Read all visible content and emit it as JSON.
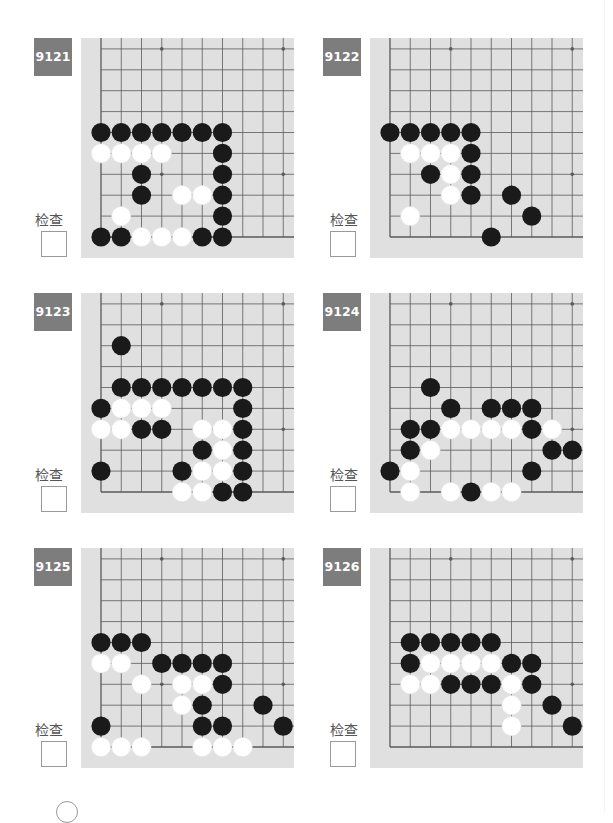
{
  "page": {
    "check_label": "检查",
    "colors": {
      "badge_bg": "#7d7d7d",
      "board_bg": "#e0e0e0",
      "grid_line": "#5a5a5a",
      "black_stone": "#1a1a1a",
      "white_stone": "#ffffff"
    }
  },
  "board_spec": {
    "columns_visible": 10,
    "rows_visible": 10,
    "corner": "bottom-left",
    "star_points": [
      [
        3,
        3
      ],
      [
        9,
        3
      ],
      [
        3,
        9
      ],
      [
        9,
        9
      ]
    ]
  },
  "problems": [
    {
      "number": "9121",
      "check_label": "检查",
      "checked": false,
      "stones": {
        "black": [
          [
            0,
            5
          ],
          [
            1,
            5
          ],
          [
            2,
            5
          ],
          [
            3,
            5
          ],
          [
            4,
            5
          ],
          [
            5,
            5
          ],
          [
            6,
            5
          ],
          [
            6,
            4
          ],
          [
            2,
            3
          ],
          [
            6,
            3
          ],
          [
            2,
            2
          ],
          [
            6,
            2
          ],
          [
            6,
            1
          ],
          [
            0,
            0
          ],
          [
            1,
            0
          ],
          [
            5,
            0
          ],
          [
            6,
            0
          ]
        ],
        "white": [
          [
            0,
            4
          ],
          [
            1,
            4
          ],
          [
            2,
            4
          ],
          [
            3,
            4
          ],
          [
            4,
            2
          ],
          [
            5,
            2
          ],
          [
            1,
            1
          ],
          [
            2,
            0
          ],
          [
            3,
            0
          ],
          [
            4,
            0
          ]
        ]
      }
    },
    {
      "number": "9122",
      "check_label": "检查",
      "checked": false,
      "stones": {
        "black": [
          [
            0,
            5
          ],
          [
            1,
            5
          ],
          [
            2,
            5
          ],
          [
            3,
            5
          ],
          [
            4,
            5
          ],
          [
            4,
            4
          ],
          [
            2,
            3
          ],
          [
            4,
            3
          ],
          [
            4,
            2
          ],
          [
            6,
            2
          ],
          [
            7,
            1
          ],
          [
            5,
            0
          ]
        ],
        "white": [
          [
            1,
            4
          ],
          [
            2,
            4
          ],
          [
            3,
            4
          ],
          [
            3,
            3
          ],
          [
            3,
            2
          ],
          [
            1,
            1
          ]
        ]
      }
    },
    {
      "number": "9123",
      "check_label": "检查",
      "checked": false,
      "stones": {
        "black": [
          [
            1,
            7
          ],
          [
            1,
            5
          ],
          [
            2,
            5
          ],
          [
            3,
            5
          ],
          [
            4,
            5
          ],
          [
            5,
            5
          ],
          [
            6,
            5
          ],
          [
            7,
            5
          ],
          [
            0,
            4
          ],
          [
            7,
            4
          ],
          [
            2,
            3
          ],
          [
            3,
            3
          ],
          [
            7,
            3
          ],
          [
            5,
            2
          ],
          [
            7,
            2
          ],
          [
            0,
            1
          ],
          [
            4,
            1
          ],
          [
            7,
            1
          ],
          [
            6,
            0
          ],
          [
            7,
            0
          ]
        ],
        "white": [
          [
            1,
            4
          ],
          [
            2,
            4
          ],
          [
            3,
            4
          ],
          [
            0,
            3
          ],
          [
            1,
            3
          ],
          [
            5,
            3
          ],
          [
            6,
            3
          ],
          [
            6,
            2
          ],
          [
            5,
            1
          ],
          [
            6,
            1
          ],
          [
            4,
            0
          ],
          [
            5,
            0
          ]
        ]
      }
    },
    {
      "number": "9124",
      "check_label": "检查",
      "checked": false,
      "stones": {
        "black": [
          [
            2,
            5
          ],
          [
            3,
            4
          ],
          [
            5,
            4
          ],
          [
            6,
            4
          ],
          [
            7,
            4
          ],
          [
            1,
            3
          ],
          [
            2,
            3
          ],
          [
            7,
            3
          ],
          [
            1,
            2
          ],
          [
            8,
            2
          ],
          [
            9,
            2
          ],
          [
            0,
            1
          ],
          [
            7,
            1
          ],
          [
            4,
            0
          ]
        ],
        "white": [
          [
            3,
            3
          ],
          [
            4,
            3
          ],
          [
            5,
            3
          ],
          [
            6,
            3
          ],
          [
            8,
            3
          ],
          [
            2,
            2
          ],
          [
            1,
            1
          ],
          [
            1,
            0
          ],
          [
            3,
            0
          ],
          [
            5,
            0
          ],
          [
            6,
            0
          ]
        ]
      }
    },
    {
      "number": "9125",
      "check_label": "检查",
      "checked": false,
      "stones": {
        "black": [
          [
            0,
            5
          ],
          [
            1,
            5
          ],
          [
            2,
            5
          ],
          [
            3,
            4
          ],
          [
            4,
            4
          ],
          [
            5,
            4
          ],
          [
            6,
            4
          ],
          [
            6,
            3
          ],
          [
            5,
            2
          ],
          [
            8,
            2
          ],
          [
            0,
            1
          ],
          [
            5,
            1
          ],
          [
            6,
            1
          ],
          [
            9,
            1
          ]
        ],
        "white": [
          [
            0,
            4
          ],
          [
            1,
            4
          ],
          [
            2,
            3
          ],
          [
            4,
            3
          ],
          [
            5,
            3
          ],
          [
            4,
            2
          ],
          [
            0,
            0
          ],
          [
            1,
            0
          ],
          [
            2,
            0
          ],
          [
            5,
            0
          ],
          [
            6,
            0
          ],
          [
            7,
            0
          ]
        ]
      }
    },
    {
      "number": "9126",
      "check_label": "检查",
      "checked": false,
      "stones": {
        "black": [
          [
            1,
            5
          ],
          [
            2,
            5
          ],
          [
            3,
            5
          ],
          [
            4,
            5
          ],
          [
            5,
            5
          ],
          [
            1,
            4
          ],
          [
            6,
            4
          ],
          [
            7,
            4
          ],
          [
            3,
            3
          ],
          [
            4,
            3
          ],
          [
            5,
            3
          ],
          [
            7,
            3
          ],
          [
            8,
            2
          ],
          [
            9,
            1
          ]
        ],
        "white": [
          [
            2,
            4
          ],
          [
            3,
            4
          ],
          [
            4,
            4
          ],
          [
            5,
            4
          ],
          [
            1,
            3
          ],
          [
            2,
            3
          ],
          [
            6,
            3
          ],
          [
            6,
            2
          ],
          [
            6,
            1
          ]
        ]
      }
    }
  ]
}
